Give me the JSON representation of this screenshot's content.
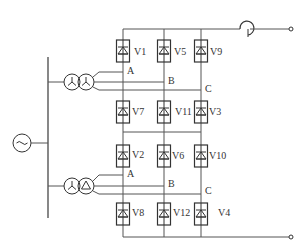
{
  "diagram": {
    "type": "twelve-pulse thyristor rectifier (two 6-pulse bridges in series)",
    "source": {
      "symbol": "ac-source",
      "label": "~"
    },
    "transformers": [
      {
        "id": "upper",
        "windings": [
          "wye",
          "wye"
        ]
      },
      {
        "id": "lower",
        "windings": [
          "wye",
          "delta"
        ]
      }
    ],
    "upper_bridge": {
      "phases": [
        "A",
        "B",
        "C"
      ],
      "top_row": [
        "V1",
        "V5",
        "V9"
      ],
      "bottom_row": [
        "V7",
        "V11",
        "V3"
      ]
    },
    "lower_bridge": {
      "phases": [
        "A",
        "B",
        "C"
      ],
      "top_row": [
        "V2",
        "V6",
        "V10"
      ],
      "bottom_row": [
        "V8",
        "V12",
        "V4"
      ]
    },
    "output": {
      "inductor": "smoothing-reactor",
      "terminals": 2
    }
  }
}
